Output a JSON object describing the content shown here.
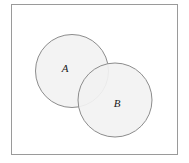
{
  "figure": {
    "name": "venn-diagram",
    "background_color": "#ffffff",
    "frame": {
      "name": "outer-frame",
      "x": 11,
      "y": 4,
      "width": 167,
      "height": 151,
      "stroke_color": "#9a9a9a",
      "stroke_width": 1,
      "fill": "none"
    },
    "sets": [
      {
        "id": "set-a",
        "label": "A",
        "cx": 72,
        "cy": 71,
        "r": 36.5,
        "fill_color": "#f2f2f2",
        "stroke_color": "#8c8c8c",
        "stroke_width": 1,
        "label_x": 65,
        "label_y": 69
      },
      {
        "id": "set-b",
        "label": "B",
        "cx": 115,
        "cy": 100,
        "r": 37,
        "fill_color": "#f2f2f2",
        "stroke_color": "#8c8c8c",
        "stroke_width": 1,
        "label_x": 117,
        "label_y": 104
      }
    ]
  }
}
